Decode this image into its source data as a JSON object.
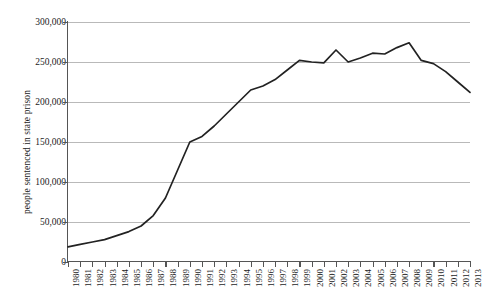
{
  "chart_data": {
    "type": "line",
    "title": "",
    "xlabel": "",
    "ylabel": "people sentenced in state prison",
    "xlim": [
      1980,
      2013
    ],
    "ylim": [
      0,
      300000
    ],
    "grid": true,
    "legend": false,
    "legend_position": "none",
    "line_color": "#222222",
    "y_ticks": [
      0,
      50000,
      100000,
      150000,
      200000,
      250000,
      300000
    ],
    "y_tick_labels": [
      "0",
      "50,000",
      "100,000",
      "150,000",
      "200,000",
      "250,000",
      "300,000"
    ],
    "categories": [
      "1980",
      "1981",
      "1982",
      "1983",
      "1984",
      "1985",
      "1986",
      "1987",
      "1988",
      "1989",
      "1990",
      "1991",
      "1992",
      "1993",
      "1994",
      "1995",
      "1996",
      "1997",
      "1998",
      "1999",
      "2000",
      "2001",
      "2002",
      "2003",
      "2004",
      "2005",
      "2006",
      "2007",
      "2008",
      "2009",
      "2010",
      "2011",
      "2012",
      "2013"
    ],
    "x": [
      1980,
      1981,
      1982,
      1983,
      1984,
      1985,
      1986,
      1987,
      1988,
      1989,
      1990,
      1991,
      1992,
      1993,
      1994,
      1995,
      1996,
      1997,
      1998,
      1999,
      2000,
      2001,
      2002,
      2003,
      2004,
      2005,
      2006,
      2007,
      2008,
      2009,
      2010,
      2011,
      2012,
      2013
    ],
    "values": [
      19000,
      22000,
      25000,
      28000,
      33000,
      38000,
      45000,
      58000,
      80000,
      115000,
      150000,
      157000,
      170000,
      185000,
      200000,
      215000,
      220000,
      228000,
      240000,
      252000,
      250000,
      249000,
      265000,
      250000,
      255000,
      261000,
      260000,
      268000,
      274000,
      252000,
      248000,
      238000,
      225000,
      212000
    ],
    "series": [
      {
        "name": "people sentenced in state prison",
        "values": [
          19000,
          22000,
          25000,
          28000,
          33000,
          38000,
          45000,
          58000,
          80000,
          115000,
          150000,
          157000,
          170000,
          185000,
          200000,
          215000,
          220000,
          228000,
          240000,
          252000,
          250000,
          249000,
          265000,
          250000,
          255000,
          261000,
          260000,
          268000,
          274000,
          252000,
          248000,
          238000,
          225000,
          212000
        ]
      }
    ]
  }
}
